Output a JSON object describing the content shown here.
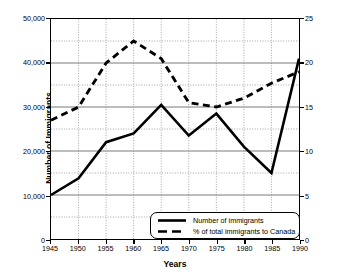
{
  "chart_data": {
    "type": "line",
    "title": "",
    "xlabel": "Years",
    "ylabel": "Number of Immigrants",
    "ylabel_right": "% of total Immigrants to Canada",
    "x": [
      1945,
      1950,
      1955,
      1960,
      1965,
      1970,
      1975,
      1980,
      1985,
      1990
    ],
    "xtick_labels": [
      "1945",
      "1950",
      "1955",
      "1960",
      "1965",
      "1970",
      "1975",
      "1980",
      "1985",
      "1990"
    ],
    "xlim": [
      1945,
      1990
    ],
    "ylim": [
      0,
      50000
    ],
    "ytick_values": [
      0,
      10000,
      20000,
      30000,
      40000,
      50000
    ],
    "ytick_labels": [
      "0",
      "10,000",
      "20,000",
      "30,000",
      "40,000",
      "50,000"
    ],
    "yminor_values": [
      5000,
      15000,
      25000,
      35000,
      45000
    ],
    "ylim_right": [
      0,
      25
    ],
    "ytick_values_right": [
      0,
      5,
      10,
      15,
      20,
      25
    ],
    "ytick_labels_right": [
      "0",
      "5",
      "10",
      "15",
      "20",
      "25"
    ],
    "grid": true,
    "legend_position": "bottom-right",
    "series": [
      {
        "name": "Number of immigrants",
        "axis": "left",
        "style": "solid",
        "color": "#000000",
        "values": [
          10000,
          13800,
          22000,
          24000,
          30500,
          23500,
          28500,
          21000,
          15000,
          41000
        ]
      },
      {
        "name": "% of total immigrants to Canada",
        "axis": "right",
        "style": "dashed",
        "color": "#000000",
        "values": [
          13.5,
          15.0,
          20.0,
          22.5,
          20.5,
          15.5,
          15.0,
          16.0,
          17.7,
          19.0
        ]
      }
    ]
  },
  "legend": {
    "items": [
      {
        "label": "Number of immigrants",
        "style": "solid"
      },
      {
        "label": "% of total immigrants to Canada",
        "style": "dashed"
      }
    ]
  }
}
